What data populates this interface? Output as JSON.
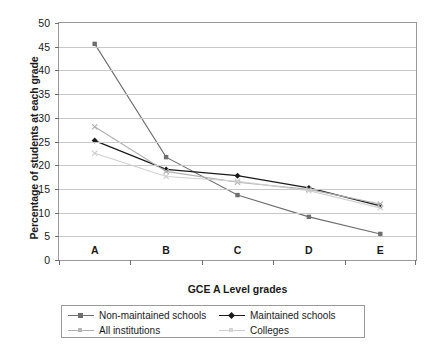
{
  "chart_data": {
    "type": "line",
    "title": "",
    "xlabel": "GCE A Level grades",
    "ylabel": "Percentage of students at each grade",
    "categories": [
      "A",
      "B",
      "C",
      "D",
      "E"
    ],
    "ylim": [
      0,
      50
    ],
    "ytick_step": 5,
    "yticks": [
      "0",
      "5",
      "10",
      "15",
      "20",
      "25",
      "30",
      "35",
      "40",
      "45",
      "50"
    ],
    "grid": true,
    "legend_position": "below-plot",
    "series": [
      {
        "name": "Non-maintained schools",
        "values": [
          45.6,
          21.7,
          13.7,
          9.1,
          5.5
        ],
        "color": "#6e6e6e",
        "marker": "square"
      },
      {
        "name": "Maintained schools",
        "values": [
          25.2,
          19.1,
          17.8,
          15.2,
          11.4
        ],
        "color": "#1a1a1a",
        "marker": "diamond"
      },
      {
        "name": "All institutions",
        "values": [
          28.1,
          18.7,
          16.4,
          14.9,
          11.8
        ],
        "color": "#b0b0b0",
        "marker": "cross"
      },
      {
        "name": "Colleges",
        "values": [
          22.5,
          17.6,
          16.6,
          14.6,
          11.0
        ],
        "color": "#cfcfcf",
        "marker": "cross"
      }
    ]
  },
  "caption": ""
}
